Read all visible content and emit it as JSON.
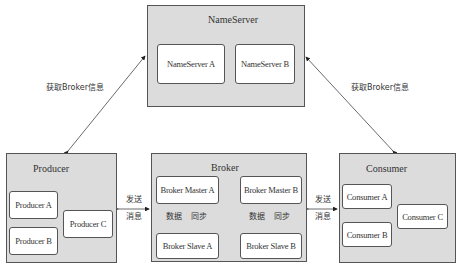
{
  "nameserver": {
    "title": "NameServer",
    "nodes": [
      "NameServer A",
      "NameServer B"
    ]
  },
  "producer": {
    "title": "Producer",
    "nodes": [
      "Producer A",
      "Producer B",
      "Producer C"
    ]
  },
  "broker": {
    "title": "Broker",
    "masters": [
      "Broker Master A",
      "Broker Master B"
    ],
    "slaves": [
      "Broker Slave A",
      "Broker Slave B"
    ],
    "sync_left": "数据",
    "sync_right": "同步"
  },
  "consumer": {
    "title": "Consumer",
    "nodes": [
      "Consumer A",
      "Consumer B",
      "Consumer C"
    ]
  },
  "edges": {
    "get_broker_info_left": "获取Broker信息",
    "get_broker_info_right": "获取Broker信息",
    "send_msg_line1": "发送",
    "send_msg_line2": "消息"
  },
  "colors": {
    "group_fill": "#dcdcdc",
    "node_fill": "#ffffff",
    "stroke": "#555555"
  }
}
